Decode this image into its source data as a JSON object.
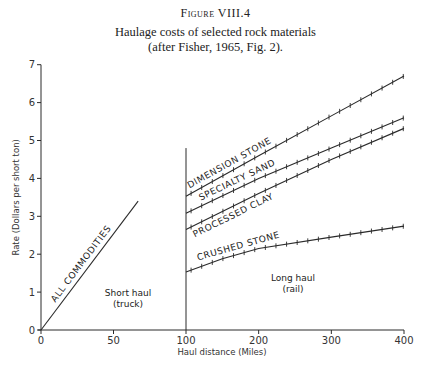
{
  "figure": {
    "label": "Figure VIII.4",
    "caption_line1": "Haulage costs of selected rock materials",
    "caption_line2": "(after Fisher, 1965, Fig. 2)."
  },
  "chart_data": {
    "type": "line",
    "title": "Haulage costs of selected rock materials (after Fisher, 1965, Fig. 2).",
    "xlabel": "Haul distance (Miles)",
    "ylabel": "Rate (Dollars per short ton)",
    "xlim": [
      0,
      400
    ],
    "ylim": [
      0,
      7
    ],
    "x_axis_note": "broken scale: 0-100 miles plotted at ~2x the scale of 100-400 miles",
    "x_ticks": [
      0,
      50,
      100,
      200,
      300,
      400
    ],
    "y_ticks": [
      0,
      1,
      2,
      3,
      4,
      5,
      6,
      7
    ],
    "grid": false,
    "legend": "none (inline labels)",
    "regions": [
      {
        "label_line1": "Short haul",
        "label_line2": "(truck)",
        "x_range": [
          0,
          100
        ]
      },
      {
        "label_line1": "Long haul",
        "label_line2": "(rail)",
        "x_range": [
          100,
          400
        ]
      }
    ],
    "divider": {
      "x": 100,
      "y_top": 4.8
    },
    "series": [
      {
        "name": "ALL COMMODITIES",
        "points": [
          [
            0,
            0
          ],
          [
            67,
            3.4
          ]
        ]
      },
      {
        "name": "DIMENSION STONE",
        "points": [
          [
            100,
            3.53
          ],
          [
            200,
            4.6
          ],
          [
            300,
            5.65
          ],
          [
            400,
            6.7
          ]
        ]
      },
      {
        "name": "SPECIALTY SAND",
        "points": [
          [
            100,
            3.08
          ],
          [
            200,
            4.0
          ],
          [
            300,
            4.8
          ],
          [
            400,
            5.6
          ]
        ]
      },
      {
        "name": "PROCESSED CLAY",
        "points": [
          [
            100,
            2.65
          ],
          [
            200,
            3.6
          ],
          [
            300,
            4.5
          ],
          [
            400,
            5.32
          ]
        ]
      },
      {
        "name": "CRUSHED STONE",
        "points": [
          [
            100,
            1.53
          ],
          [
            150,
            1.88
          ],
          [
            200,
            2.15
          ],
          [
            300,
            2.45
          ],
          [
            400,
            2.74
          ]
        ]
      }
    ]
  }
}
